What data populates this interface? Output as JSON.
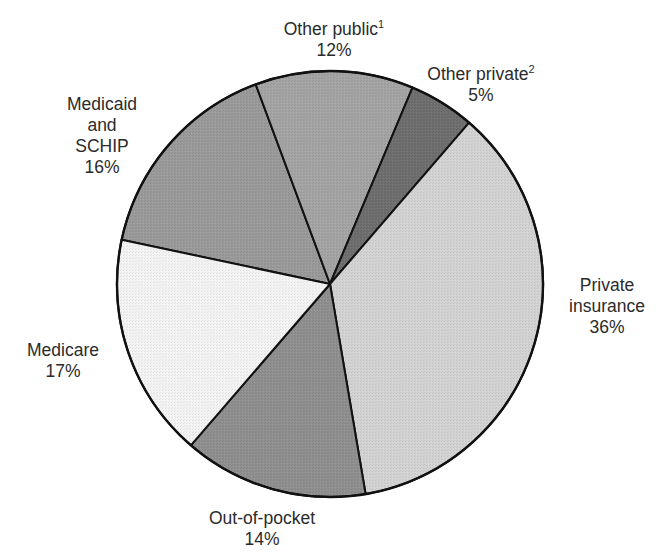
{
  "chart_data": {
    "type": "pie",
    "title": "",
    "start_boundary": "Medicare / Medicaid and SCHIP",
    "direction": "clockwise",
    "slices": [
      {
        "name": "Medicaid and SCHIP",
        "label_lines": [
          "Medicaid",
          "and",
          "SCHIP"
        ],
        "value": 16,
        "percent_label": "16%",
        "footnote": "",
        "color": "#9a9a9a"
      },
      {
        "name": "Other public",
        "label_lines": [
          "Other public"
        ],
        "value": 12,
        "percent_label": "12%",
        "footnote": "1",
        "color": "#a4a4a4"
      },
      {
        "name": "Other private",
        "label_lines": [
          "Other private"
        ],
        "value": 5,
        "percent_label": "5%",
        "footnote": "2",
        "color": "#6e6e6e"
      },
      {
        "name": "Private insurance",
        "label_lines": [
          "Private",
          "insurance"
        ],
        "value": 36,
        "percent_label": "36%",
        "footnote": "",
        "color": "#d3d3d3"
      },
      {
        "name": "Out-of-pocket",
        "label_lines": [
          "Out-of-pocket"
        ],
        "value": 14,
        "percent_label": "14%",
        "footnote": "",
        "color": "#8f8f8f"
      },
      {
        "name": "Medicare",
        "label_lines": [
          "Medicare"
        ],
        "value": 17,
        "percent_label": "17%",
        "footnote": "",
        "color": "#f3f3f3"
      }
    ],
    "legend": "none (direct labels)",
    "border_color": "#111111"
  },
  "labels": {
    "medicaid": {
      "l1": "Medicaid",
      "l2": "and",
      "l3": "SCHIP",
      "pct": "16%"
    },
    "other_public": {
      "l1": "Other public",
      "sup": "1",
      "pct": "12%"
    },
    "other_private": {
      "l1": "Other private",
      "sup": "2",
      "pct": "5%"
    },
    "private_insurance": {
      "l1": "Private",
      "l2": "insurance",
      "pct": "36%"
    },
    "out_of_pocket": {
      "l1": "Out-of-pocket",
      "pct": "14%"
    },
    "medicare": {
      "l1": "Medicare",
      "pct": "17%"
    }
  }
}
